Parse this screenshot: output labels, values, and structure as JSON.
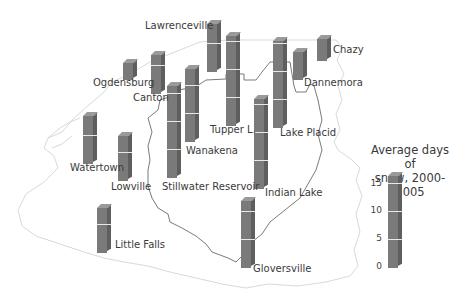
{
  "chart_data": {
    "type": "bar",
    "subtype": "3d-bars-on-map",
    "title": "Average days of snow, 2000-2005",
    "units_px_per_day": 5.6,
    "legend": {
      "title_line1": "Average days of",
      "title_line2": "snow, 2000-2005",
      "ticks": [
        "0",
        "5",
        "10",
        "15"
      ],
      "tick_values": [
        0,
        5,
        10,
        15
      ]
    },
    "categories": [
      "Lawrenceville",
      "Ogdensburg",
      "Canton",
      "Tupper L.",
      "Lake Placid",
      "Dannemora",
      "Chazy",
      "Wanakena",
      "Stillwater Reservoir",
      "Indian Lake",
      "Watertown",
      "Lowville",
      "Little Falls",
      "Gloversville"
    ],
    "values": [
      8.5,
      3,
      7,
      16,
      15.5,
      5,
      4,
      13,
      16.5,
      16,
      8.5,
      8,
      8,
      12
    ],
    "ylim": [
      0,
      17
    ],
    "grid": false,
    "legend_position": "right"
  },
  "bars": [
    {
      "name": "Lawrenceville",
      "value": 8.5,
      "x": 207,
      "base": 72,
      "label_x": 145,
      "label_y": 27
    },
    {
      "name": "Ogdensburg",
      "value": 3,
      "x": 123,
      "base": 80,
      "label_x": 93,
      "label_y": 80
    },
    {
      "name": "Canton",
      "value": 7,
      "x": 151,
      "base": 94,
      "label_x": 133,
      "label_y": 94
    },
    {
      "name": "Tupper L.",
      "value": 16,
      "x": 226,
      "base": 126,
      "label_x": 210,
      "label_y": 125
    },
    {
      "name": "Lake Placid",
      "value": 15.5,
      "x": 273,
      "base": 128,
      "label_x": 280,
      "label_y": 127
    },
    {
      "name": "Dannemora",
      "value": 5,
      "x": 293,
      "base": 80,
      "label_x": 304,
      "label_y": 78
    },
    {
      "name": "Chazy",
      "value": 4,
      "x": 317,
      "base": 61,
      "label_x": 333,
      "label_y": 46
    },
    {
      "name": "Wanakena",
      "value": 13,
      "x": 185,
      "base": 142,
      "label_x": 185,
      "label_y": 145
    },
    {
      "name": "Stillwater Reservoir",
      "value": 16.5,
      "x": 167,
      "base": 178,
      "label_x": 162,
      "label_y": 182
    },
    {
      "name": "Indian Lake",
      "value": 16,
      "x": 254,
      "base": 189,
      "label_x": 265,
      "label_y": 188
    },
    {
      "name": "Watertown",
      "value": 8.5,
      "x": 83,
      "base": 164,
      "label_x": 70,
      "label_y": 162
    },
    {
      "name": "Lowville",
      "value": 8,
      "x": 118,
      "base": 181,
      "label_x": 111,
      "label_y": 181
    },
    {
      "name": "Little Falls",
      "value": 8,
      "x": 97,
      "base": 253,
      "label_x": 115,
      "label_y": 239
    },
    {
      "name": "Gloversville",
      "value": 12,
      "x": 241,
      "base": 268,
      "label_x": 253,
      "label_y": 264
    }
  ],
  "legend_bar": {
    "value": 16.5,
    "x": 388,
    "base": 268
  },
  "colors": {
    "bar_front": "#7a7a7a",
    "bar_side": "#5e5e5e",
    "bar_cap": "#9a9a9a",
    "bar_tick": "#e8e8e8",
    "park_boundary": "#6b6b6b",
    "state_outline": "#d9d9d9",
    "text": "#3a3a3a"
  }
}
